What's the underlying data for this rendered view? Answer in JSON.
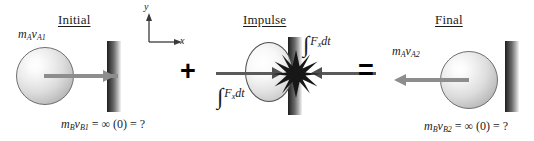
{
  "figure": {
    "background_color": "#ffffff",
    "width": 534,
    "height": 141
  },
  "operators": {
    "plus": "+",
    "equals": "="
  },
  "axes": {
    "y_label": "y",
    "x_label": "x"
  },
  "panels": [
    {
      "id": "initial",
      "title": "Initial",
      "momentum_label": {
        "m": "m",
        "m_sub": "A",
        "v": "v",
        "v_sub": "A1"
      },
      "wall_label": {
        "m": "m",
        "m_sub": "B",
        "v": "v",
        "v_sub": "B1",
        "rest": "= ∞ (0) = ?"
      },
      "arrow_direction": "right"
    },
    {
      "id": "impulse",
      "title": "Impulse",
      "impulse_label_top": {
        "integral": "∫",
        "f": "F",
        "f_sub": "x",
        "dt": "dt"
      },
      "impulse_label_bottom": {
        "integral": "∫",
        "f": "F",
        "f_sub": "x",
        "dt": "dt"
      },
      "arrow_directions": [
        "right",
        "left"
      ]
    },
    {
      "id": "final",
      "title": "Final",
      "momentum_label": {
        "m": "m",
        "m_sub": "A",
        "v": "v",
        "v_sub": "A2"
      },
      "wall_label": {
        "m": "m",
        "m_sub": "B",
        "v": "v",
        "v_sub": "B2",
        "rest": "= ∞ (0) = ?"
      },
      "arrow_direction": "left"
    }
  ],
  "colors": {
    "text": "#1b1b1b",
    "arrow": "#8d8d8d",
    "arrow_dark": "#4f4f4f",
    "wall_dark": "#1d1d1d",
    "wall_light": "#f2f2f2",
    "sphere_outline": "#6f6f6f",
    "burst": "#1a1a1a"
  }
}
